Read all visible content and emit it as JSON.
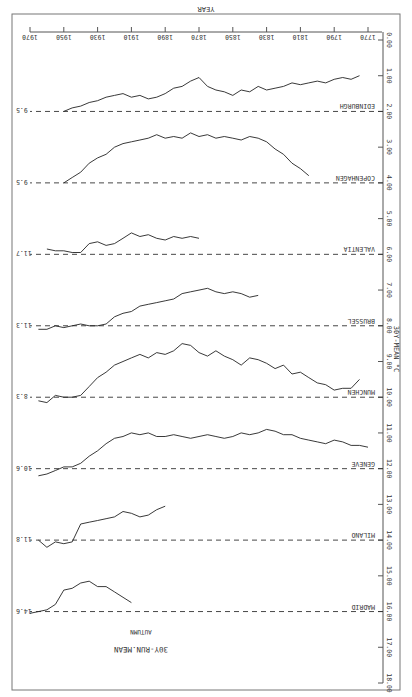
{
  "chart_data": {
    "type": "line",
    "title": "30Y-RUN.MEAN",
    "subtitle": "AUTUMN",
    "xlabel": "YEAR",
    "ylabel": "30Y-MEAN °C",
    "orientation_note": "figure rendered rotated 180 degrees",
    "x_ticks": [
      1770,
      1790,
      1810,
      1830,
      1850,
      1870,
      1890,
      1910,
      1930,
      1950,
      1970
    ],
    "xlim": [
      1770,
      1970
    ],
    "y_ticks": [
      "0.00",
      "1.00",
      "2.00",
      "3.00",
      "4.00",
      "5.00",
      "6.00",
      "7.00",
      "8.00",
      "9.00",
      "10.00",
      "11.00",
      "12.00",
      "13.00",
      "14.00",
      "15.00",
      "16.00",
      "17.00",
      "18.00"
    ],
    "ylim": [
      0,
      18
    ],
    "grid": false,
    "series": [
      {
        "name": "EDINBURGH",
        "baseline": 9.5,
        "baseline_axis": 2.0,
        "x": [
          1775,
          1780,
          1785,
          1790,
          1795,
          1800,
          1805,
          1810,
          1815,
          1820,
          1825,
          1830,
          1835,
          1840,
          1845,
          1850,
          1855,
          1860,
          1865,
          1870,
          1875,
          1880,
          1885,
          1890,
          1895,
          1900,
          1905,
          1910,
          1915,
          1920,
          1925,
          1930,
          1935,
          1940,
          1945,
          1950
        ],
        "y": [
          1.0,
          1.1,
          1.05,
          1.1,
          1.2,
          1.15,
          1.2,
          1.25,
          1.2,
          1.3,
          1.35,
          1.4,
          1.3,
          1.45,
          1.4,
          1.55,
          1.45,
          1.4,
          1.3,
          1.05,
          1.15,
          1.3,
          1.35,
          1.5,
          1.6,
          1.65,
          1.55,
          1.6,
          1.5,
          1.55,
          1.6,
          1.7,
          1.75,
          1.85,
          1.9,
          2.0
        ]
      },
      {
        "name": "COPENHAGEN",
        "baseline": 9.5,
        "baseline_axis": 4.0,
        "x": [
          1805,
          1810,
          1815,
          1820,
          1825,
          1830,
          1835,
          1840,
          1845,
          1850,
          1855,
          1860,
          1865,
          1870,
          1875,
          1880,
          1885,
          1890,
          1895,
          1900,
          1905,
          1910,
          1915,
          1920,
          1925,
          1930,
          1935,
          1940,
          1945,
          1950
        ],
        "y": [
          3.8,
          3.6,
          3.45,
          3.2,
          3.05,
          2.85,
          2.75,
          2.7,
          2.8,
          2.75,
          2.7,
          2.75,
          2.65,
          2.7,
          2.6,
          2.75,
          2.7,
          2.75,
          2.65,
          2.75,
          2.8,
          2.85,
          2.9,
          3.0,
          3.2,
          3.3,
          3.45,
          3.7,
          3.85,
          4.0
        ]
      },
      {
        "name": "VALENTIA",
        "baseline": 11.7,
        "baseline_axis": 6.0,
        "x": [
          1870,
          1875,
          1880,
          1885,
          1890,
          1895,
          1900,
          1905,
          1910,
          1915,
          1920,
          1925,
          1930,
          1935,
          1940,
          1945,
          1950,
          1955,
          1960
        ],
        "y": [
          5.55,
          5.5,
          5.55,
          5.5,
          5.6,
          5.55,
          5.45,
          5.5,
          5.4,
          5.55,
          5.7,
          5.75,
          5.65,
          5.7,
          5.95,
          5.95,
          5.9,
          5.9,
          5.85
        ]
      },
      {
        "name": "BRUSSEL",
        "baseline": 11.3,
        "baseline_axis": 8.0,
        "x": [
          1835,
          1840,
          1845,
          1850,
          1855,
          1860,
          1865,
          1870,
          1875,
          1880,
          1885,
          1890,
          1895,
          1900,
          1905,
          1910,
          1915,
          1920,
          1925,
          1930,
          1935,
          1940,
          1945,
          1950,
          1955,
          1960,
          1965
        ],
        "y": [
          7.15,
          7.2,
          7.1,
          7.05,
          7.1,
          7.05,
          6.95,
          7.0,
          7.05,
          7.1,
          7.25,
          7.3,
          7.35,
          7.4,
          7.45,
          7.6,
          7.65,
          7.75,
          7.95,
          8.0,
          8.0,
          7.95,
          8.0,
          8.05,
          8.0,
          8.1,
          8.1
        ]
      },
      {
        "name": "MUNCHEN",
        "baseline": 8.3,
        "baseline_axis": 10.0,
        "x": [
          1775,
          1780,
          1785,
          1790,
          1795,
          1800,
          1805,
          1810,
          1815,
          1820,
          1825,
          1830,
          1835,
          1840,
          1845,
          1850,
          1855,
          1860,
          1865,
          1870,
          1875,
          1880,
          1885,
          1890,
          1895,
          1900,
          1905,
          1910,
          1915,
          1920,
          1925,
          1930,
          1935,
          1940,
          1945,
          1950,
          1955,
          1960,
          1965
        ],
        "y": [
          9.5,
          9.75,
          9.75,
          9.8,
          9.65,
          9.6,
          9.45,
          9.3,
          9.35,
          9.1,
          9.2,
          9.05,
          8.95,
          8.9,
          9.1,
          8.95,
          8.85,
          8.7,
          8.85,
          8.75,
          8.55,
          8.5,
          8.7,
          8.8,
          8.75,
          8.9,
          8.8,
          8.9,
          9.0,
          9.1,
          9.3,
          9.45,
          9.7,
          9.95,
          10.0,
          10.0,
          9.95,
          10.15,
          10.1
        ]
      },
      {
        "name": "GENEVE",
        "baseline": 10.6,
        "baseline_axis": 12.0,
        "x": [
          1770,
          1775,
          1780,
          1785,
          1790,
          1795,
          1800,
          1805,
          1810,
          1815,
          1820,
          1825,
          1830,
          1835,
          1840,
          1845,
          1850,
          1855,
          1860,
          1865,
          1870,
          1875,
          1880,
          1885,
          1890,
          1895,
          1900,
          1905,
          1910,
          1915,
          1920,
          1925,
          1930,
          1935,
          1940,
          1945,
          1950,
          1955,
          1960,
          1965
        ],
        "y": [
          11.4,
          11.35,
          11.35,
          11.25,
          11.2,
          11.3,
          11.25,
          11.2,
          11.15,
          11.05,
          11.05,
          10.95,
          10.9,
          11.0,
          11.05,
          11.0,
          11.1,
          11.15,
          11.1,
          11.05,
          11.1,
          11.15,
          11.1,
          11.05,
          11.1,
          11.1,
          11.0,
          11.05,
          11.0,
          11.1,
          11.15,
          11.3,
          11.5,
          11.65,
          11.85,
          11.95,
          11.95,
          12.05,
          12.15,
          12.2
        ]
      },
      {
        "name": "MILANO",
        "baseline": 11.8,
        "baseline_axis": 14.0,
        "x": [
          1890,
          1895,
          1900,
          1905,
          1910,
          1915,
          1920,
          1925,
          1930,
          1935,
          1940,
          1945,
          1950,
          1955,
          1960,
          1965
        ],
        "y": [
          13.05,
          13.15,
          13.3,
          13.35,
          13.25,
          13.2,
          13.35,
          13.4,
          13.45,
          13.5,
          13.55,
          14.05,
          14.1,
          14.05,
          14.2,
          14.0
        ]
      },
      {
        "name": "MADRID",
        "baseline": 14.6,
        "baseline_axis": 16.0,
        "x": [
          1910,
          1915,
          1920,
          1925,
          1930,
          1935,
          1940,
          1945,
          1950,
          1955,
          1960,
          1965,
          1970
        ],
        "y": [
          15.75,
          15.6,
          15.45,
          15.3,
          15.3,
          15.15,
          15.2,
          15.35,
          15.4,
          15.8,
          15.95,
          16.0,
          16.05
        ]
      }
    ]
  },
  "labels": {
    "title": "30Y-RUN.MEAN",
    "subtitle": "AUTUMN",
    "xlabel": "YEAR",
    "ylabel": "30Y-MEAN   °C"
  }
}
